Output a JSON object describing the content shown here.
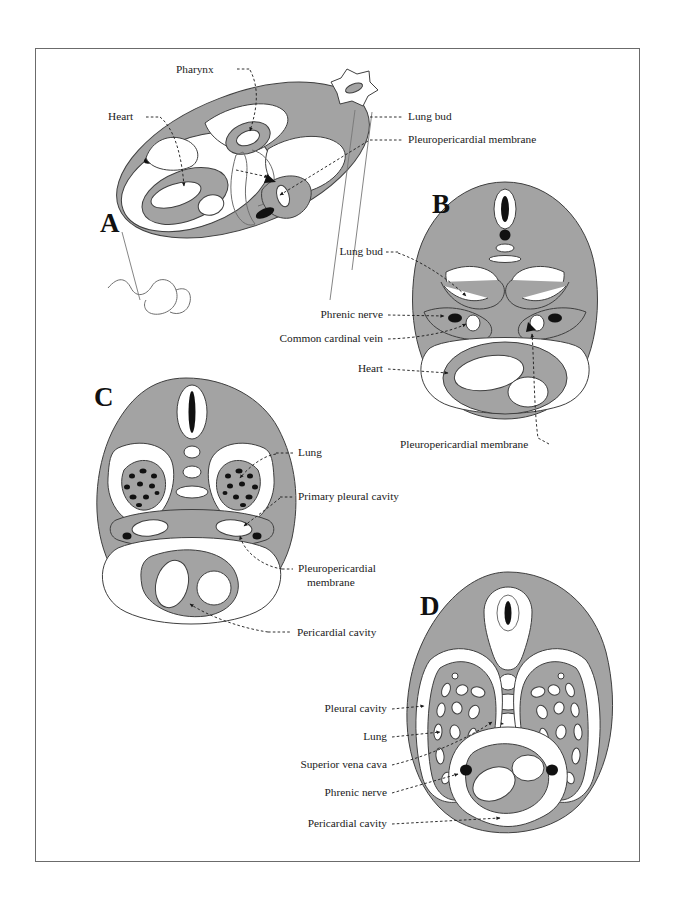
{
  "figure": {
    "background_color": "#ffffff",
    "frame_color": "#6b6b6b",
    "tissue_color": "#a3a3a3",
    "cavity_color": "#ffffff",
    "structure_color": "#111111"
  },
  "panels": [
    {
      "id": "A",
      "letter": "A",
      "labels": [
        {
          "id": "a-pharynx",
          "text": "Pharynx"
        },
        {
          "id": "a-heart",
          "text": "Heart"
        },
        {
          "id": "a-lung-bud",
          "text": "Lung bud"
        },
        {
          "id": "a-pleuropericardial-membrane",
          "text": "Pleuropericardial membrane"
        }
      ]
    },
    {
      "id": "B",
      "letter": "B",
      "labels": [
        {
          "id": "b-lung-bud",
          "text": "Lung bud"
        },
        {
          "id": "b-phrenic-nerve",
          "text": "Phrenic nerve"
        },
        {
          "id": "b-common-cardinal-vein",
          "text": "Common cardinal vein"
        },
        {
          "id": "b-heart",
          "text": "Heart"
        },
        {
          "id": "b-pleuropericardial-membrane",
          "text": "Pleuropericardial membrane"
        }
      ]
    },
    {
      "id": "C",
      "letter": "C",
      "labels": [
        {
          "id": "c-lung",
          "text": "Lung"
        },
        {
          "id": "c-primary-pleural-cavity",
          "text": "Primary pleural cavity"
        },
        {
          "id": "c-pleuropericardial-membrane-line1",
          "text": "Pleuropericardial"
        },
        {
          "id": "c-pleuropericardial-membrane-line2",
          "text": "membrane"
        },
        {
          "id": "c-pericardial-cavity",
          "text": "Pericardial cavity"
        }
      ]
    },
    {
      "id": "D",
      "letter": "D",
      "labels": [
        {
          "id": "d-pleural-cavity",
          "text": "Pleural cavity"
        },
        {
          "id": "d-lung",
          "text": "Lung"
        },
        {
          "id": "d-superior-vena-cava",
          "text": "Superior vena cava"
        },
        {
          "id": "d-phrenic-nerve",
          "text": "Phrenic nerve"
        },
        {
          "id": "d-pericardial-cavity",
          "text": "Pericardial cavity"
        }
      ]
    }
  ]
}
